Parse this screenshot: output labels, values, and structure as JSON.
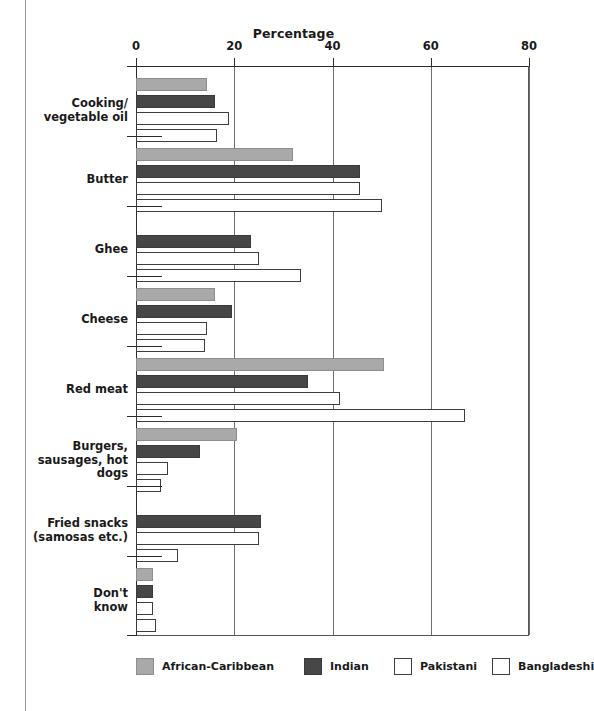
{
  "chart_data": {
    "type": "bar",
    "orientation": "horizontal",
    "title": "Percentage",
    "xlabel": "Percentage",
    "ylabel": "",
    "xlim": [
      0,
      80
    ],
    "xticks": [
      0,
      20,
      40,
      60,
      80
    ],
    "xtick_labels": [
      "0",
      "20",
      "40",
      "60",
      "80"
    ],
    "grid": true,
    "legend_position": "bottom",
    "categories": [
      "Cooking/\nvegetable oil",
      "Butter",
      "Ghee",
      "Cheese",
      "Red meat",
      "Burgers,\nsausages, hot dogs",
      "Fried snacks\n(samosas etc.)",
      "Don't\nknow"
    ],
    "series": [
      {
        "name": "African-Caribbean",
        "color": "#a9a9a9",
        "values": [
          14.5,
          32,
          0,
          16,
          50.5,
          20.5,
          0,
          3.5
        ]
      },
      {
        "name": "Indian",
        "color": "#474747",
        "values": [
          16,
          45.5,
          23.5,
          19.5,
          35,
          13,
          25.5,
          3.5
        ]
      },
      {
        "name": "Pakistani",
        "color": "#ffffff",
        "values": [
          19,
          45.5,
          25,
          14.5,
          41.5,
          6.5,
          25,
          3.5
        ]
      },
      {
        "name": "Bangladeshi",
        "color": "#ffffff",
        "values": [
          16.5,
          50,
          33.5,
          14,
          67,
          5,
          8.5,
          4
        ]
      }
    ]
  },
  "categories": [
    {
      "line1": "Cooking/",
      "line2": "vegetable oil"
    },
    {
      "line1": "Butter",
      "line2": ""
    },
    {
      "line1": "Ghee",
      "line2": ""
    },
    {
      "line1": "Cheese",
      "line2": ""
    },
    {
      "line1": "Red meat",
      "line2": ""
    },
    {
      "line1": "Burgers,",
      "line2": "sausages, hot dogs"
    },
    {
      "line1": "Fried snacks",
      "line2": "(samosas etc.)"
    },
    {
      "line1": "Don't",
      "line2": "know"
    }
  ],
  "axis": {
    "title": "Percentage",
    "ticks": [
      "0",
      "20",
      "40",
      "60",
      "80"
    ]
  },
  "legend": [
    {
      "label": "African-Caribbean",
      "key": "ac"
    },
    {
      "label": "Indian",
      "key": "ind"
    },
    {
      "label": "Pakistani",
      "key": "pak"
    },
    {
      "label": "Bangladeshi",
      "key": "ban"
    }
  ]
}
